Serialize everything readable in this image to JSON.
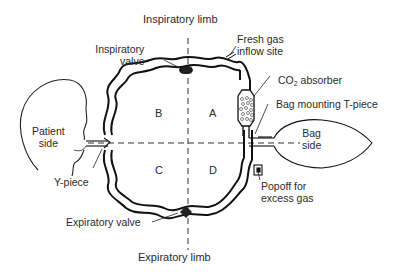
{
  "diagram": {
    "type": "circle-system-schematic",
    "labels": {
      "inspiratory_limb": "Inspiratory limb",
      "expiratory_limb": "Expiratory limb",
      "inspiratory_valve_line1": "Inspiratory",
      "inspiratory_valve_line2": "valve",
      "fresh_gas_line1": "Fresh gas",
      "fresh_gas_line2": "inflow site",
      "co2_prefix": "CO",
      "co2_sub": "2",
      "co2_suffix": " absorber",
      "bag_mount": "Bag mounting T-piece",
      "bag_side_line1": "Bag",
      "bag_side_line2": "side",
      "patient_side_line1": "Patient",
      "patient_side_line2": "side",
      "y_piece": "Y-piece",
      "expiratory_valve": "Expiratory valve",
      "popoff_line1": "Popoff for",
      "popoff_line2": "excess gas"
    },
    "quadrants": {
      "a": "A",
      "b": "B",
      "c": "C",
      "d": "D"
    },
    "colors": {
      "line": "#1a1a1a",
      "text": "#2a2a2a",
      "background": "#ffffff"
    }
  }
}
